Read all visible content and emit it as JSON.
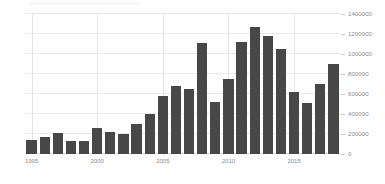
{
  "chart_data": {
    "type": "bar",
    "title": "",
    "subtitle": "",
    "xlabel": "",
    "ylabel": "",
    "categories": [
      "1995",
      "1996",
      "1997",
      "1998",
      "1999",
      "2000",
      "2001",
      "2002",
      "2003",
      "2004",
      "2005",
      "2006",
      "2007",
      "2008",
      "2009",
      "2010",
      "2011",
      "2012",
      "2013",
      "2014",
      "2015",
      "2016",
      "2017",
      "2018"
    ],
    "values": [
      140000,
      170000,
      210000,
      130000,
      135000,
      260000,
      220000,
      205000,
      300000,
      400000,
      580000,
      685000,
      650000,
      1110000,
      520000,
      755000,
      1120000,
      1270000,
      1180000,
      1050000,
      620000,
      515000,
      700000,
      900000
    ],
    "series": [
      {
        "name": "",
        "values": [
          140000,
          170000,
          210000,
          130000,
          135000,
          260000,
          220000,
          205000,
          300000,
          400000,
          580000,
          685000,
          650000,
          1110000,
          520000,
          755000,
          1120000,
          1270000,
          1180000,
          1050000,
          620000,
          515000,
          700000,
          900000
        ]
      }
    ],
    "ylim": [
      0,
      1400000
    ],
    "ytick_values": [
      0,
      200000,
      400000,
      600000,
      800000,
      1000000,
      1200000,
      1400000
    ],
    "ytick_labels": [
      "0",
      "200000",
      "400000",
      "600000",
      "800000",
      "1000000",
      "1200000",
      "1400000"
    ],
    "xtick_labels": [
      "1995",
      "2000",
      "2005",
      "2010",
      "2015"
    ],
    "xtick_categories": [
      "1995",
      "2000",
      "2005",
      "2010",
      "2015"
    ],
    "grid": true,
    "grid_axis": "both",
    "legend": false,
    "legend_position": "none",
    "bar_color": "#474747",
    "grid_color": "#e9e9e9",
    "axis_label_color": "#8a8a8a",
    "background_color": "#ffffff",
    "y_axis_position": "right"
  }
}
